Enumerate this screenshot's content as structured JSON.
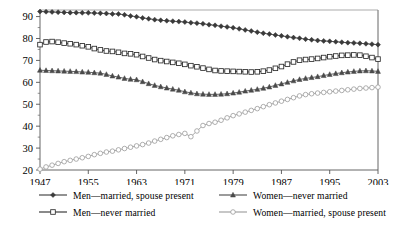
{
  "chart_data": {
    "type": "line",
    "title": "",
    "xlabel": "",
    "ylabel": "",
    "xlim": [
      1947,
      2003
    ],
    "ylim": [
      20,
      93
    ],
    "grid": false,
    "legend_position": "bottom",
    "y_ticks": [
      20,
      30,
      40,
      50,
      60,
      70,
      80,
      90
    ],
    "y_tick_labels": [
      "20",
      "30",
      "40",
      "50",
      "60",
      "70",
      "80",
      "90"
    ],
    "x_ticks": [
      1947,
      1955,
      1963,
      1971,
      1979,
      1987,
      1995,
      2003
    ],
    "x_tick_labels": [
      "1947",
      "1955",
      "1963",
      "1971",
      "1979",
      "1987",
      "1995",
      "2003"
    ],
    "x": [
      1947,
      1948,
      1949,
      1950,
      1951,
      1952,
      1953,
      1954,
      1955,
      1956,
      1957,
      1958,
      1959,
      1960,
      1961,
      1962,
      1963,
      1964,
      1965,
      1966,
      1967,
      1968,
      1969,
      1970,
      1971,
      1972,
      1973,
      1974,
      1975,
      1976,
      1977,
      1978,
      1979,
      1980,
      1981,
      1982,
      1983,
      1984,
      1985,
      1986,
      1987,
      1988,
      1989,
      1990,
      1991,
      1992,
      1993,
      1994,
      1995,
      1996,
      1997,
      1998,
      1999,
      2000,
      2001,
      2002,
      2003
    ],
    "series": [
      {
        "name": "Men—married, spouse present",
        "marker": "filled-diamond",
        "color": "#3a3a3a",
        "values": [
          92.3,
          92.2,
          92.1,
          92.0,
          91.9,
          91.8,
          91.8,
          91.7,
          91.7,
          91.6,
          91.5,
          91.4,
          91.2,
          91.2,
          90.8,
          90.3,
          89.9,
          89.4,
          89.0,
          88.6,
          88.3,
          88.1,
          87.9,
          87.7,
          87.5,
          87.2,
          87.0,
          86.7,
          86.3,
          86.0,
          85.6,
          85.3,
          84.9,
          84.4,
          83.9,
          83.4,
          82.9,
          82.4,
          82.0,
          81.6,
          81.2,
          80.8,
          80.4,
          80.1,
          79.7,
          79.4,
          79.1,
          78.9,
          78.7,
          78.5,
          78.3,
          78.1,
          78.0,
          77.8,
          77.6,
          77.4,
          77.2
        ]
      },
      {
        "name": "Men—never married",
        "marker": "open-square",
        "color": "#2b2b2b",
        "values": [
          77.2,
          78.4,
          78.6,
          78.3,
          77.9,
          77.6,
          77.2,
          76.7,
          76.2,
          75.4,
          74.8,
          74.3,
          74.1,
          73.7,
          73.2,
          73.0,
          72.6,
          71.8,
          71.1,
          70.4,
          69.9,
          69.5,
          69.1,
          68.7,
          68.2,
          67.6,
          67.1,
          66.5,
          65.9,
          65.4,
          65.2,
          65.1,
          65.0,
          64.9,
          64.8,
          64.7,
          64.8,
          65.1,
          65.6,
          66.4,
          67.2,
          68.3,
          69.3,
          70.1,
          70.4,
          70.6,
          70.9,
          71.3,
          71.7,
          72.0,
          72.3,
          72.4,
          72.5,
          72.4,
          71.9,
          71.3,
          70.6
        ]
      },
      {
        "name": "Women—never married",
        "marker": "filled-triangle",
        "color": "#4a4a4a",
        "values": [
          65.5,
          65.4,
          65.3,
          65.2,
          65.1,
          65.0,
          64.9,
          64.7,
          64.6,
          64.4,
          64.2,
          63.6,
          62.9,
          62.4,
          61.8,
          61.4,
          61.2,
          60.3,
          59.4,
          58.6,
          58.0,
          57.4,
          56.9,
          56.4,
          55.7,
          55.2,
          54.8,
          54.6,
          54.5,
          54.5,
          54.6,
          54.8,
          55.1,
          55.5,
          56.0,
          56.4,
          56.8,
          57.3,
          57.9,
          58.6,
          59.3,
          60.0,
          60.7,
          61.3,
          61.8,
          62.2,
          62.6,
          63.1,
          63.6,
          64.0,
          64.4,
          64.7,
          65.0,
          65.2,
          65.3,
          65.2,
          65.0
        ]
      },
      {
        "name": "Women—married, spouse present",
        "marker": "open-circle",
        "color": "#9a9a9a",
        "values": [
          20.4,
          21.4,
          22.2,
          23.0,
          23.8,
          24.4,
          25.0,
          25.6,
          26.2,
          27.0,
          27.6,
          28.2,
          28.6,
          29.2,
          29.8,
          30.4,
          31.0,
          31.6,
          32.3,
          33.2,
          34.0,
          34.8,
          35.6,
          36.2,
          36.7,
          35.2,
          37.8,
          40.3,
          41.2,
          41.8,
          42.7,
          43.8,
          44.8,
          45.6,
          46.4,
          47.2,
          48.0,
          48.9,
          49.8,
          50.6,
          51.4,
          52.2,
          53.0,
          53.8,
          54.4,
          54.8,
          55.1,
          55.4,
          55.7,
          56.0,
          56.3,
          56.6,
          56.9,
          57.2,
          57.4,
          57.6,
          57.8
        ]
      }
    ]
  },
  "axes": {
    "y_tick_labels": [
      "90",
      "80",
      "70",
      "60",
      "50",
      "40",
      "30",
      "20"
    ],
    "x_tick_labels": [
      "1947",
      "1955",
      "1963",
      "1971",
      "1979",
      "1987",
      "1995",
      "2003"
    ]
  },
  "legend": {
    "entries": [
      {
        "label": "Men—married, spouse present",
        "marker": "filled-diamond",
        "color": "#3a3a3a",
        "row": 0,
        "col": 0
      },
      {
        "label": "Men—never married",
        "marker": "open-square",
        "color": "#2b2b2b",
        "row": 1,
        "col": 0
      },
      {
        "label": "Women—never married",
        "marker": "filled-triangle",
        "color": "#4a4a4a",
        "row": 0,
        "col": 1
      },
      {
        "label": "Women—married, spouse present",
        "marker": "open-circle",
        "color": "#9a9a9a",
        "row": 1,
        "col": 1
      }
    ]
  }
}
